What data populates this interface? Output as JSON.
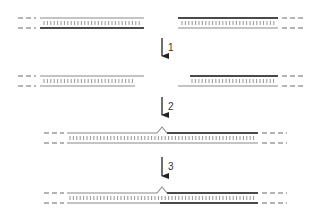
{
  "diagram": {
    "type": "dna-repair-steps",
    "colors": {
      "thin_strand": "#8a8a8a",
      "thick_strand": "#4a4a4a",
      "base_pairs": "#7a7a7a",
      "dashes": "#6a6a6a",
      "arrow": "#222222"
    },
    "steps": [
      {
        "label": "1",
        "arrow_x": 162,
        "y1": 38,
        "y2": 63,
        "label_x": 168,
        "label_y": 51
      },
      {
        "label": "2",
        "arrow_x": 162,
        "y1": 97,
        "y2": 122,
        "label_x": 168,
        "label_y": 110
      },
      {
        "label": "3",
        "arrow_x": 162,
        "y1": 157,
        "y2": 183,
        "label_x": 168,
        "label_y": 170
      }
    ],
    "rows": [
      {
        "name": "row-1-gapped-ends",
        "top_y": 18,
        "bottom_y": 28,
        "left_dashes": [
          18,
          36
        ],
        "right_dashes": [
          282,
          306
        ],
        "segments": [
          {
            "strand": "top",
            "x1": 40,
            "x2": 144,
            "weight": "thin"
          },
          {
            "strand": "bottom",
            "x1": 40,
            "x2": 144,
            "weight": "thick"
          },
          {
            "strand": "top",
            "x1": 178,
            "x2": 278,
            "weight": "thick"
          },
          {
            "strand": "bottom",
            "x1": 178,
            "x2": 278,
            "weight": "thin"
          }
        ],
        "base_pairs": [
          [
            44,
            140
          ],
          [
            182,
            274
          ]
        ],
        "flap_x": null
      },
      {
        "name": "row-2-resected-ends",
        "top_y": 76,
        "bottom_y": 86,
        "left_dashes": [
          18,
          36
        ],
        "right_dashes": [
          282,
          306
        ],
        "segments": [
          {
            "strand": "top",
            "x1": 40,
            "x2": 144,
            "weight": "thin"
          },
          {
            "strand": "bottom",
            "x1": 40,
            "x2": 135,
            "weight": "thin"
          },
          {
            "strand": "top",
            "x1": 190,
            "x2": 278,
            "weight": "thick"
          },
          {
            "strand": "bottom",
            "x1": 178,
            "x2": 278,
            "weight": "thin"
          }
        ],
        "base_pairs": [
          [
            44,
            133
          ],
          [
            192,
            274
          ]
        ],
        "flap_x": null
      },
      {
        "name": "row-3-annealed-with-flap",
        "top_y": 133,
        "bottom_y": 143,
        "left_dashes": [
          44,
          64
        ],
        "right_dashes": [
          262,
          287
        ],
        "segments": [
          {
            "strand": "top",
            "x1": 67,
            "x2": 157,
            "weight": "thin"
          },
          {
            "strand": "top",
            "x1": 167,
            "x2": 258,
            "weight": "thick"
          },
          {
            "strand": "bottom",
            "x1": 67,
            "x2": 258,
            "weight": "thin"
          }
        ],
        "base_pairs": [
          [
            70,
            254
          ]
        ],
        "flap_x": 162
      },
      {
        "name": "row-4-ligated",
        "top_y": 193,
        "bottom_y": 203,
        "left_dashes": [
          44,
          64
        ],
        "right_dashes": [
          262,
          287
        ],
        "segments": [
          {
            "strand": "top",
            "x1": 67,
            "x2": 157,
            "weight": "thin"
          },
          {
            "strand": "top",
            "x1": 167,
            "x2": 258,
            "weight": "thick"
          },
          {
            "strand": "bottom",
            "x1": 67,
            "x2": 160,
            "weight": "thin"
          },
          {
            "strand": "bottom",
            "x1": 160,
            "x2": 258,
            "weight": "thick"
          }
        ],
        "base_pairs": [
          [
            70,
            254
          ]
        ],
        "flap_x": 162
      }
    ]
  }
}
